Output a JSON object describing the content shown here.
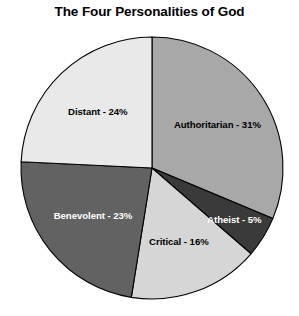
{
  "chart_data": {
    "type": "pie",
    "title": "The Four Personalities of God",
    "xlabel": "",
    "ylabel": "",
    "legend": "none",
    "grid": false,
    "labels": [
      "Authoritarian",
      "Atheist",
      "Critical",
      "Benevolent",
      "Distant"
    ],
    "values": [
      31,
      5,
      16,
      23,
      24
    ],
    "unit": "%",
    "start_angle_deg": 0,
    "direction": "clockwise",
    "slice_labels": [
      "Authoritarian - 31%",
      "Atheist - 5%",
      "Critical - 16%",
      "Benevolent - 23%",
      "Distant - 24%"
    ],
    "slice_colors": [
      "#a8a8a8",
      "#3a3a3a",
      "#d6d6d6",
      "#626262",
      "#e9e9e9"
    ],
    "slice_label_colors": [
      "#000000",
      "#ffffff",
      "#000000",
      "#ffffff",
      "#000000"
    ],
    "outline_color": "#000000",
    "background_color": "#ffffff"
  },
  "slices": [
    {
      "name": "Authoritarian",
      "value": 31,
      "label": "Authoritarian - 31%",
      "color": "#a8a8a8",
      "text_color": "#000000"
    },
    {
      "name": "Atheist",
      "value": 5,
      "label": "Atheist - 5%",
      "color": "#3a3a3a",
      "text_color": "#ffffff"
    },
    {
      "name": "Critical",
      "value": 16,
      "label": "Critical - 16%",
      "color": "#d6d6d6",
      "text_color": "#000000"
    },
    {
      "name": "Benevolent",
      "value": 23,
      "label": "Benevolent - 23%",
      "color": "#626262",
      "text_color": "#ffffff"
    },
    {
      "name": "Distant",
      "value": 24,
      "label": "Distant - 24%",
      "color": "#e9e9e9",
      "text_color": "#000000"
    }
  ],
  "geometry": {
    "cx": 152,
    "cy": 168,
    "r": 131
  }
}
